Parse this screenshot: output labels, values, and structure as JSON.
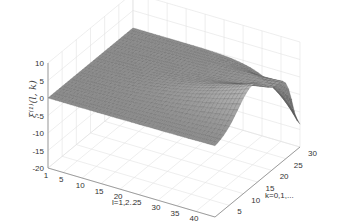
{
  "chart_data": {
    "type": "surface3d",
    "title": "",
    "xlabel": "l=1,2...",
    "ylabel": "k=0,1,...",
    "zlabel": "ξ^(1)(l,k)",
    "zlabel_display": "ξ⁽¹⁾(l, k)",
    "xlim": [
      1,
      45
    ],
    "ylim": [
      0,
      30
    ],
    "zlim": [
      -20,
      10
    ],
    "xticks": [
      "1",
      "5",
      "10",
      "15",
      "20",
      "25",
      "30",
      "35",
      "40",
      "45"
    ],
    "yticks": [
      "0",
      "5",
      "10",
      "15",
      "20",
      "25",
      "30"
    ],
    "zticks": [
      "10",
      "5",
      "0",
      "-5",
      "-10",
      "-15",
      "-20"
    ],
    "grid": true,
    "colormap": "gray",
    "approx_features": [
      {
        "l": 1,
        "k": 0,
        "z": 0
      },
      {
        "l": 1,
        "k": 30,
        "z": 0
      },
      {
        "l": 45,
        "k": 0,
        "z": 0
      },
      {
        "l": 40,
        "k": 15,
        "z": 9
      },
      {
        "l": 45,
        "k": 25,
        "z": 2
      },
      {
        "l": 45,
        "k": 30,
        "z": -14
      }
    ]
  }
}
